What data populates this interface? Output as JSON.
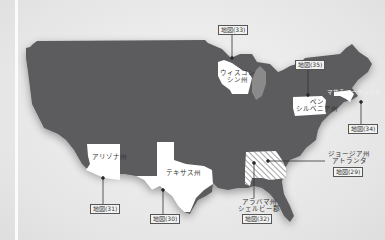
{
  "colors": {
    "us_fill": "#5c5c5e",
    "highlight_fill": "#ffffff",
    "lake": "#8a8a8a",
    "background": "#e9e9e9",
    "leader_line": "#333333"
  },
  "states": {
    "wisconsin": {
      "label": "ウィスコン\nシン州",
      "line1": "ウィスコン",
      "line2": "シン州",
      "map_ref": "地図(33)"
    },
    "pennsylvania": {
      "line1": "ペン",
      "line2": "シルベニア州",
      "map_ref": "地図(35)"
    },
    "massachusetts": {
      "line1": "マサチューセッツ州",
      "map_ref": "地図(34)"
    },
    "arizona": {
      "line1": "アリゾナ州",
      "map_ref": "地図(31)"
    },
    "texas": {
      "line1": "テキサス州",
      "map_ref": "地図(30)"
    },
    "georgia": {
      "line1": "ジョージア州",
      "line2": "アトランタ",
      "map_ref": "地図(29)"
    },
    "alabama": {
      "line1": "アラバマ州",
      "line2": "シェルビー郡",
      "map_ref": "地図(32)"
    }
  }
}
